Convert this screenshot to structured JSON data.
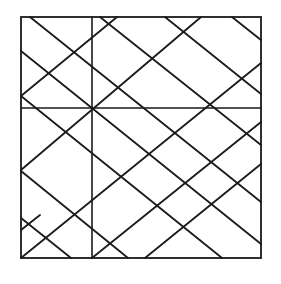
{
  "diagram": {
    "width": 281,
    "height": 284,
    "stroke": "#1a1a1a",
    "background": "#ffffff",
    "frame": {
      "x": 21,
      "y": 17,
      "w": 240,
      "h": 241
    },
    "axes": {
      "vertical": {
        "x": 92,
        "y1": 17,
        "y2": 258
      },
      "horizontal": {
        "y": 108,
        "x1": 21,
        "x2": 261
      }
    },
    "down_right_lines": [
      [
        30,
        17,
        261,
        202
      ],
      [
        21,
        51,
        261,
        244
      ],
      [
        21,
        96,
        222,
        258
      ],
      [
        21,
        171,
        128,
        258
      ],
      [
        21,
        218,
        71,
        258
      ],
      [
        100,
        17,
        261,
        145
      ],
      [
        165,
        17,
        261,
        94
      ],
      [
        232,
        17,
        261,
        40
      ]
    ],
    "up_right_lines": [
      [
        21,
        96,
        117,
        17
      ],
      [
        21,
        170,
        201,
        17
      ],
      [
        21,
        258,
        261,
        63
      ],
      [
        92,
        258,
        261,
        122
      ],
      [
        145,
        258,
        261,
        164
      ],
      [
        21,
        230,
        40,
        215
      ]
    ]
  }
}
